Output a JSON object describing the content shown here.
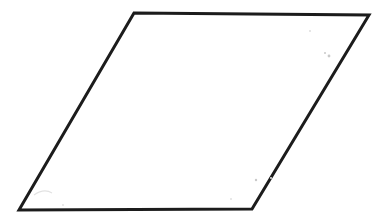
{
  "figure": {
    "shape_name": "parallelogram",
    "background_color": "#ffffff",
    "stroke_color": "#1c1c1c",
    "fill_color": "#ffffff",
    "stroke_width": 3,
    "canvas": {
      "width": 378,
      "height": 221
    },
    "vertices": [
      {
        "label": "top-left",
        "x": 134,
        "y": 13
      },
      {
        "label": "top-right",
        "x": 369,
        "y": 15
      },
      {
        "label": "bottom-right",
        "x": 252,
        "y": 209
      },
      {
        "label": "bottom-left",
        "x": 19,
        "y": 210
      }
    ],
    "points_attr": "134,13 369,15 252,209 19,210",
    "edges": [
      {
        "name": "top-edge",
        "from": "top-left",
        "to": "top-right"
      },
      {
        "name": "right-edge",
        "from": "top-right",
        "to": "bottom-right"
      },
      {
        "name": "bottom-edge",
        "from": "bottom-right",
        "to": "bottom-left"
      },
      {
        "name": "left-edge",
        "from": "bottom-left",
        "to": "top-left"
      }
    ],
    "scan_artifacts": [
      {
        "name": "speck-upper-right-a",
        "x": 310,
        "y": 31,
        "r": 1.1,
        "tone": "faint"
      },
      {
        "name": "speck-upper-right-b",
        "x": 325,
        "y": 53,
        "r": 1.0,
        "tone": "normal"
      },
      {
        "name": "speck-upper-right-c",
        "x": 329,
        "y": 56,
        "r": 1.4,
        "tone": "normal"
      },
      {
        "name": "speck-lower-right-a",
        "x": 256,
        "y": 180,
        "r": 1.2,
        "tone": "normal"
      },
      {
        "name": "speck-lower-right-b",
        "x": 271,
        "y": 178,
        "r": 1.0,
        "tone": "faint"
      },
      {
        "name": "speck-lower-middle",
        "x": 231,
        "y": 199,
        "r": 1.0,
        "tone": "faint"
      },
      {
        "name": "speck-lower-left",
        "x": 63,
        "y": 205,
        "r": 0.9,
        "tone": "faint"
      }
    ],
    "smudge_path": "M 34 195 Q 44 188 52 193"
  }
}
